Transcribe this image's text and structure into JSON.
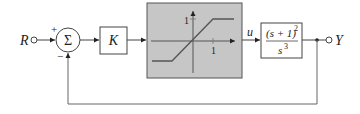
{
  "diagram": {
    "type": "feedback-control-block-diagram",
    "input": {
      "label": "R"
    },
    "output": {
      "label": "Y"
    },
    "summer": {
      "symbol": "Σ",
      "plus_sign": "+",
      "minus_sign": "−"
    },
    "gain_block": {
      "label": "K"
    },
    "saturation_block": {
      "kind": "saturation nonlinearity",
      "y_tick": "1",
      "x_tick": "1",
      "fill_color": "#c8c8c8"
    },
    "signal_u": {
      "label": "u"
    },
    "plant_block": {
      "numerator": "(s + 1)",
      "numerator_exponent": "2",
      "denominator": "s",
      "denominator_exponent": "3"
    },
    "colors": {
      "line": "#333333",
      "block_fill": "#ffffff"
    }
  }
}
